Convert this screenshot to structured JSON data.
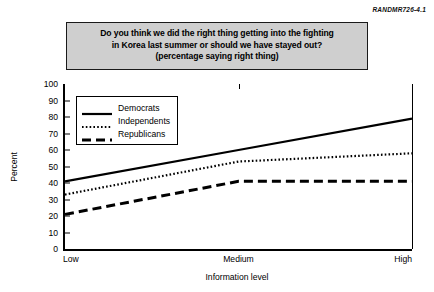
{
  "figure_label": "RANDMR726-4.1",
  "title": {
    "line1": "Do you think we did the right thing getting into the fighting",
    "line2": "in Korea last summer or should we have stayed out?",
    "line3": "(percentage saying right thing)"
  },
  "legend": {
    "position": "inside-top-left",
    "items": [
      {
        "label": "Democrats",
        "style": "solid"
      },
      {
        "label": "Independents",
        "style": "dotted"
      },
      {
        "label": "Republicans",
        "style": "dashed"
      }
    ]
  },
  "chart_data": {
    "type": "line",
    "title": "Do you think we did the right thing getting into the fighting in Korea last summer or should we have stayed out? (percentage saying right thing)",
    "xlabel": "Information level",
    "ylabel": "Percent",
    "categories": [
      "Low",
      "Medium",
      "High"
    ],
    "yticks": [
      0,
      10,
      20,
      30,
      40,
      50,
      60,
      70,
      80,
      90,
      100
    ],
    "ylim": [
      0,
      100
    ],
    "grid": false,
    "series": [
      {
        "name": "Democrats",
        "style": "solid",
        "values": [
          41,
          60,
          79
        ]
      },
      {
        "name": "Independents",
        "style": "dotted",
        "values": [
          33,
          53,
          58
        ]
      },
      {
        "name": "Republicans",
        "style": "dashed",
        "values": [
          21,
          41,
          41
        ]
      }
    ]
  }
}
